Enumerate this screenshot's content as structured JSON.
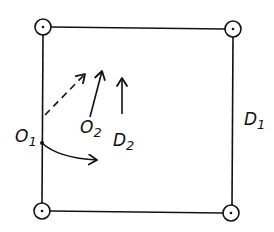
{
  "diagram": {
    "type": "geometry-sketch",
    "ink_color": "#111111",
    "background": "#ffffff",
    "square": {
      "x1": 43,
      "y1": 27,
      "x2": 233,
      "y2": 212
    },
    "corner_markers": [
      {
        "name": "top-left",
        "cx": 43,
        "cy": 27
      },
      {
        "name": "top-right",
        "cx": 233,
        "cy": 29
      },
      {
        "name": "bottom-left",
        "cx": 42,
        "cy": 211
      },
      {
        "name": "bottom-right",
        "cx": 231,
        "cy": 213
      }
    ],
    "labels": {
      "o1": {
        "main": "O",
        "sub": "1"
      },
      "o2": {
        "main": "O",
        "sub": "2"
      },
      "d1": {
        "main": "D",
        "sub": "1"
      },
      "d2": {
        "main": "D",
        "sub": "2"
      }
    },
    "arrows": [
      {
        "name": "dashed-arrow",
        "style": "dashed",
        "from": [
          45,
          115
        ],
        "to": [
          85,
          74
        ]
      },
      {
        "name": "o2-arrow",
        "style": "solid",
        "from": [
          90,
          117
        ],
        "to": [
          102,
          71
        ]
      },
      {
        "name": "d2-arrow",
        "style": "solid",
        "from": [
          122,
          114
        ],
        "to": [
          122,
          78
        ]
      },
      {
        "name": "curved-arrow",
        "style": "solid-curved",
        "from": [
          42,
          143
        ],
        "to": [
          97,
          160
        ]
      }
    ]
  }
}
